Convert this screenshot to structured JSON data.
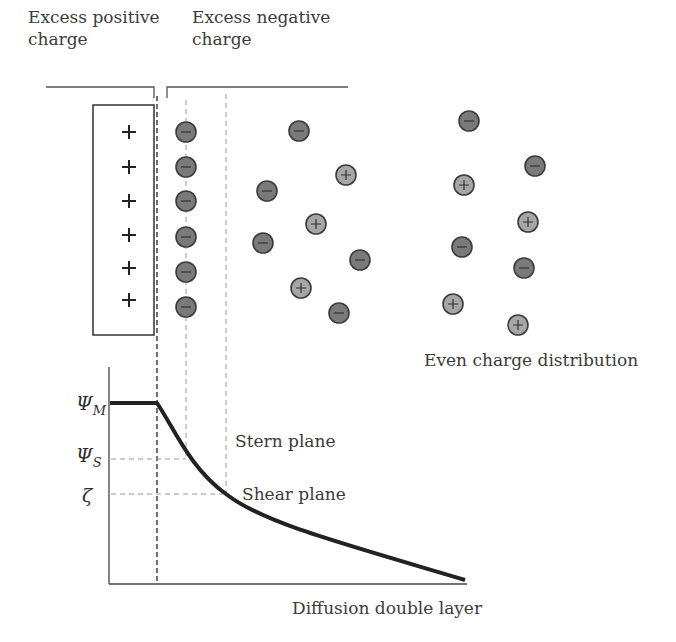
{
  "labels": {
    "excess_positive": [
      "Excess positive",
      "charge"
    ],
    "excess_negative": [
      "Excess negative",
      "charge"
    ],
    "even_distribution": "Even charge distribution",
    "stern_plane": "Stern plane",
    "shear_plane": "Shear plane",
    "diffusion_layer": "Diffusion double layer"
  },
  "symbols": {
    "psi_m": {
      "main": "Ψ",
      "sub": "M"
    },
    "psi_s": {
      "main": "Ψ",
      "sub": "S"
    },
    "zeta": "ζ"
  },
  "surface": {
    "charges": [
      "+",
      "+",
      "+",
      "+",
      "+",
      "+"
    ]
  },
  "ions": {
    "stern_layer": [
      {
        "x": 186,
        "y": 132,
        "sign": "-"
      },
      {
        "x": 186,
        "y": 167,
        "sign": "-"
      },
      {
        "x": 186,
        "y": 201,
        "sign": "-"
      },
      {
        "x": 186,
        "y": 237,
        "sign": "-"
      },
      {
        "x": 186,
        "y": 272,
        "sign": "-"
      },
      {
        "x": 186,
        "y": 307,
        "sign": "-"
      }
    ],
    "diffuse_layer": [
      {
        "x": 299,
        "y": 131,
        "sign": "-"
      },
      {
        "x": 346,
        "y": 175,
        "sign": "+"
      },
      {
        "x": 267,
        "y": 191,
        "sign": "-"
      },
      {
        "x": 316,
        "y": 224,
        "sign": "+"
      },
      {
        "x": 263,
        "y": 243,
        "sign": "-"
      },
      {
        "x": 360,
        "y": 260,
        "sign": "-"
      },
      {
        "x": 301,
        "y": 288,
        "sign": "+"
      },
      {
        "x": 339,
        "y": 313,
        "sign": "-"
      }
    ],
    "bulk": [
      {
        "x": 469,
        "y": 121,
        "sign": "-"
      },
      {
        "x": 535,
        "y": 166,
        "sign": "-"
      },
      {
        "x": 464,
        "y": 185,
        "sign": "+"
      },
      {
        "x": 528,
        "y": 222,
        "sign": "+"
      },
      {
        "x": 462,
        "y": 247,
        "sign": "-"
      },
      {
        "x": 524,
        "y": 268,
        "sign": "-"
      },
      {
        "x": 453,
        "y": 304,
        "sign": "+"
      },
      {
        "x": 518,
        "y": 325,
        "sign": "+"
      }
    ]
  },
  "colors": {
    "negative_ion": "#7a7a7a",
    "positive_ion": "#a6a6a6",
    "ion_stroke": "#3c3c3c",
    "line": "#2b2b2b",
    "dashed": "#8a8a8a"
  },
  "potential_curve": {
    "psi_m_level_y": 403,
    "psi_s_level_y": 459,
    "zeta_level_y": 494,
    "surface_x": 157,
    "stern_x": 186,
    "shear_x": 226,
    "end_x": 465,
    "end_y": 580
  }
}
